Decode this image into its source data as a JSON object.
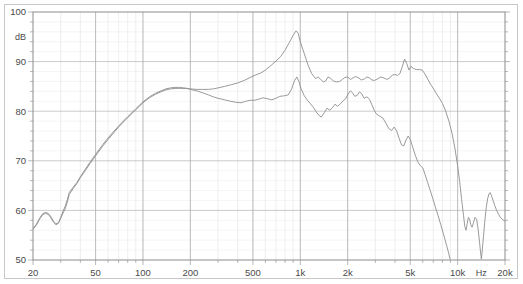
{
  "chart_data": {
    "type": "line",
    "title": "",
    "subtitle": "",
    "xlabel": "Hz",
    "ylabel": "dB",
    "xscale": "log",
    "xlim": [
      20,
      20000
    ],
    "ylim": [
      50,
      100
    ],
    "grid": true,
    "legend": false,
    "legend_position": "none",
    "x_ticks": [
      {
        "value": 20,
        "label": "20"
      },
      {
        "value": 50,
        "label": "50"
      },
      {
        "value": 100,
        "label": "100"
      },
      {
        "value": 200,
        "label": "200"
      },
      {
        "value": 500,
        "label": "500"
      },
      {
        "value": 1000,
        "label": "1k"
      },
      {
        "value": 2000,
        "label": "2k"
      },
      {
        "value": 5000,
        "label": "5k"
      },
      {
        "value": 10000,
        "label": "10k"
      },
      {
        "value": 20000,
        "label": "20k"
      }
    ],
    "y_ticks": [
      {
        "value": 100,
        "label": "100"
      },
      {
        "value": 90,
        "label": "90"
      },
      {
        "value": 80,
        "label": "80"
      },
      {
        "value": 70,
        "label": "70"
      },
      {
        "value": 60,
        "label": "60"
      },
      {
        "value": 50,
        "label": "50"
      }
    ],
    "y_minor_step": 2,
    "unit_label_y": "dB",
    "unit_label_x": "Hz",
    "series": [
      {
        "name": "on-axis-response",
        "color": "#8f8f8f",
        "points": [
          [
            20,
            56.3
          ],
          [
            21,
            57.2
          ],
          [
            22,
            58.4
          ],
          [
            23,
            59.3
          ],
          [
            24,
            59.6
          ],
          [
            25,
            59.4
          ],
          [
            26,
            58.7
          ],
          [
            27,
            57.8
          ],
          [
            28,
            57.3
          ],
          [
            29,
            57.5
          ],
          [
            30,
            58.4
          ],
          [
            31,
            59.4
          ],
          [
            32,
            60.3
          ],
          [
            33,
            61.6
          ],
          [
            34,
            63.2
          ],
          [
            36,
            64.4
          ],
          [
            38,
            65.4
          ],
          [
            40,
            66.6
          ],
          [
            43,
            68.0
          ],
          [
            46,
            69.4
          ],
          [
            50,
            71.0
          ],
          [
            55,
            72.8
          ],
          [
            60,
            74.3
          ],
          [
            65,
            75.6
          ],
          [
            70,
            76.8
          ],
          [
            75,
            77.8
          ],
          [
            80,
            78.7
          ],
          [
            85,
            79.5
          ],
          [
            90,
            80.3
          ],
          [
            95,
            81.0
          ],
          [
            100,
            81.7
          ],
          [
            110,
            82.7
          ],
          [
            120,
            83.4
          ],
          [
            130,
            83.9
          ],
          [
            140,
            84.3
          ],
          [
            150,
            84.5
          ],
          [
            160,
            84.6
          ],
          [
            170,
            84.6
          ],
          [
            180,
            84.6
          ],
          [
            190,
            84.6
          ],
          [
            200,
            84.5
          ],
          [
            220,
            84.4
          ],
          [
            240,
            84.4
          ],
          [
            260,
            84.4
          ],
          [
            280,
            84.5
          ],
          [
            300,
            84.7
          ],
          [
            330,
            85.0
          ],
          [
            360,
            85.3
          ],
          [
            400,
            85.7
          ],
          [
            440,
            86.2
          ],
          [
            480,
            86.8
          ],
          [
            520,
            87.3
          ],
          [
            560,
            87.7
          ],
          [
            600,
            88.3
          ],
          [
            650,
            89.2
          ],
          [
            700,
            90.1
          ],
          [
            750,
            91.0
          ],
          [
            800,
            92.3
          ],
          [
            850,
            93.8
          ],
          [
            900,
            95.3
          ],
          [
            940,
            96.2
          ],
          [
            970,
            95.7
          ],
          [
            1000,
            94.0
          ],
          [
            1060,
            91.6
          ],
          [
            1120,
            89.3
          ],
          [
            1180,
            87.6
          ],
          [
            1250,
            86.6
          ],
          [
            1300,
            86.9
          ],
          [
            1350,
            86.4
          ],
          [
            1400,
            85.9
          ],
          [
            1450,
            86.1
          ],
          [
            1500,
            86.9
          ],
          [
            1560,
            86.6
          ],
          [
            1620,
            86.1
          ],
          [
            1700,
            85.9
          ],
          [
            1780,
            86.0
          ],
          [
            1850,
            86.4
          ],
          [
            1920,
            86.8
          ],
          [
            2000,
            86.9
          ],
          [
            2080,
            86.4
          ],
          [
            2160,
            86.7
          ],
          [
            2250,
            87.0
          ],
          [
            2350,
            86.7
          ],
          [
            2450,
            86.3
          ],
          [
            2550,
            86.5
          ],
          [
            2650,
            86.9
          ],
          [
            2750,
            86.7
          ],
          [
            2850,
            86.3
          ],
          [
            2950,
            86.2
          ],
          [
            3100,
            86.5
          ],
          [
            3250,
            86.9
          ],
          [
            3400,
            86.7
          ],
          [
            3550,
            86.4
          ],
          [
            3700,
            86.7
          ],
          [
            3850,
            87.3
          ],
          [
            4000,
            87.4
          ],
          [
            4150,
            87.2
          ],
          [
            4300,
            87.6
          ],
          [
            4450,
            89.0
          ],
          [
            4600,
            90.5
          ],
          [
            4750,
            89.6
          ],
          [
            4900,
            88.3
          ],
          [
            5050,
            89.0
          ],
          [
            5250,
            88.6
          ],
          [
            5450,
            88.4
          ],
          [
            5700,
            88.4
          ],
          [
            5950,
            88.3
          ],
          [
            6200,
            87.5
          ],
          [
            6500,
            86.3
          ],
          [
            6800,
            85.2
          ],
          [
            7100,
            84.3
          ],
          [
            7400,
            83.3
          ],
          [
            7700,
            82.5
          ],
          [
            8000,
            81.6
          ],
          [
            8400,
            80.0
          ],
          [
            8800,
            78.0
          ],
          [
            9200,
            75.6
          ],
          [
            9600,
            72.6
          ],
          [
            10000,
            69.0
          ],
          [
            10300,
            65.8
          ],
          [
            10600,
            62.2
          ],
          [
            10900,
            59.0
          ],
          [
            11100,
            56.8
          ],
          [
            11300,
            56.0
          ],
          [
            11500,
            57.3
          ],
          [
            11700,
            58.6
          ],
          [
            11900,
            58.3
          ],
          [
            12100,
            57.2
          ],
          [
            12350,
            56.6
          ],
          [
            12600,
            57.5
          ],
          [
            12900,
            58.6
          ],
          [
            13200,
            58.2
          ],
          [
            13500,
            56.2
          ],
          [
            13800,
            53.4
          ],
          [
            14000,
            51.4
          ],
          [
            14150,
            50.2
          ],
          [
            14300,
            51.6
          ],
          [
            14600,
            54.8
          ],
          [
            14900,
            58.0
          ],
          [
            15200,
            60.6
          ],
          [
            15500,
            62.3
          ],
          [
            15800,
            63.3
          ],
          [
            16100,
            63.6
          ],
          [
            16400,
            63.0
          ],
          [
            16800,
            62.0
          ],
          [
            17200,
            61.0
          ],
          [
            17700,
            60.0
          ],
          [
            18200,
            59.2
          ],
          [
            18800,
            58.5
          ],
          [
            19400,
            58.1
          ],
          [
            20000,
            57.8
          ]
        ]
      },
      {
        "name": "off-axis-response",
        "color": "#8f8f8f",
        "points": [
          [
            20,
            56.2
          ],
          [
            21,
            57.0
          ],
          [
            22,
            58.2
          ],
          [
            23,
            59.1
          ],
          [
            24,
            59.4
          ],
          [
            25,
            59.2
          ],
          [
            26,
            58.5
          ],
          [
            27,
            57.6
          ],
          [
            28,
            57.1
          ],
          [
            29,
            57.4
          ],
          [
            30,
            58.6
          ],
          [
            31,
            59.8
          ],
          [
            32,
            60.8
          ],
          [
            33,
            62.1
          ],
          [
            34,
            63.6
          ],
          [
            36,
            64.7
          ],
          [
            38,
            65.6
          ],
          [
            40,
            66.8
          ],
          [
            43,
            68.3
          ],
          [
            46,
            69.7
          ],
          [
            50,
            71.3
          ],
          [
            55,
            73.1
          ],
          [
            60,
            74.6
          ],
          [
            65,
            75.9
          ],
          [
            70,
            77.0
          ],
          [
            75,
            78.0
          ],
          [
            80,
            78.9
          ],
          [
            85,
            79.7
          ],
          [
            90,
            80.5
          ],
          [
            95,
            81.2
          ],
          [
            100,
            81.9
          ],
          [
            110,
            82.9
          ],
          [
            120,
            83.6
          ],
          [
            130,
            84.1
          ],
          [
            140,
            84.5
          ],
          [
            150,
            84.7
          ],
          [
            160,
            84.8
          ],
          [
            170,
            84.8
          ],
          [
            180,
            84.7
          ],
          [
            190,
            84.6
          ],
          [
            200,
            84.4
          ],
          [
            220,
            84.1
          ],
          [
            240,
            83.7
          ],
          [
            260,
            83.3
          ],
          [
            280,
            82.9
          ],
          [
            300,
            82.6
          ],
          [
            330,
            82.3
          ],
          [
            360,
            82.0
          ],
          [
            390,
            81.8
          ],
          [
            420,
            81.7
          ],
          [
            450,
            82.0
          ],
          [
            480,
            82.2
          ],
          [
            510,
            82.2
          ],
          [
            540,
            82.4
          ],
          [
            580,
            82.7
          ],
          [
            620,
            82.5
          ],
          [
            660,
            82.3
          ],
          [
            700,
            82.6
          ],
          [
            740,
            83.0
          ],
          [
            790,
            83.1
          ],
          [
            840,
            83.3
          ],
          [
            880,
            84.5
          ],
          [
            920,
            86.2
          ],
          [
            950,
            86.9
          ],
          [
            980,
            86.0
          ],
          [
            1010,
            84.6
          ],
          [
            1060,
            83.1
          ],
          [
            1110,
            82.2
          ],
          [
            1160,
            81.5
          ],
          [
            1210,
            80.8
          ],
          [
            1260,
            79.9
          ],
          [
            1310,
            79.2
          ],
          [
            1360,
            78.8
          ],
          [
            1420,
            79.7
          ],
          [
            1480,
            80.6
          ],
          [
            1540,
            80.2
          ],
          [
            1600,
            80.7
          ],
          [
            1660,
            81.4
          ],
          [
            1730,
            81.0
          ],
          [
            1800,
            81.5
          ],
          [
            1870,
            82.1
          ],
          [
            1940,
            82.5
          ],
          [
            2010,
            83.4
          ],
          [
            2080,
            84.1
          ],
          [
            2150,
            83.7
          ],
          [
            2220,
            83.0
          ],
          [
            2300,
            83.2
          ],
          [
            2380,
            83.9
          ],
          [
            2460,
            83.5
          ],
          [
            2550,
            82.6
          ],
          [
            2650,
            82.9
          ],
          [
            2750,
            82.4
          ],
          [
            2850,
            81.3
          ],
          [
            2950,
            80.2
          ],
          [
            3050,
            79.4
          ],
          [
            3200,
            79.0
          ],
          [
            3350,
            78.6
          ],
          [
            3500,
            77.6
          ],
          [
            3650,
            76.5
          ],
          [
            3800,
            76.1
          ],
          [
            3950,
            76.8
          ],
          [
            4100,
            76.0
          ],
          [
            4250,
            74.5
          ],
          [
            4400,
            73.2
          ],
          [
            4550,
            73.0
          ],
          [
            4700,
            74.2
          ],
          [
            4850,
            75.0
          ],
          [
            5000,
            74.3
          ],
          [
            5200,
            72.6
          ],
          [
            5400,
            71.0
          ],
          [
            5600,
            69.7
          ],
          [
            5800,
            69.0
          ],
          [
            6000,
            68.6
          ],
          [
            6200,
            67.3
          ],
          [
            6450,
            65.6
          ],
          [
            6700,
            64.0
          ],
          [
            6950,
            62.4
          ],
          [
            7200,
            60.8
          ],
          [
            7500,
            59.0
          ],
          [
            7800,
            57.2
          ],
          [
            8100,
            55.4
          ],
          [
            8400,
            53.6
          ],
          [
            8700,
            51.8
          ],
          [
            8950,
            50.2
          ]
        ]
      }
    ]
  },
  "plot_geometry": {
    "left": 33,
    "right": 505,
    "top": 12,
    "bottom": 260
  }
}
